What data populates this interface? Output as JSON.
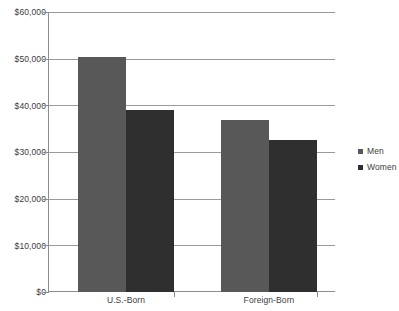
{
  "chart_data": {
    "type": "bar",
    "title": "",
    "subtitle": "",
    "xlabel": "",
    "ylabel": "",
    "categories": [
      "U.S.-Born",
      "Foreign-Born"
    ],
    "series": [
      {
        "name": "Men",
        "values": [
          50400,
          36900
        ],
        "color": "#585858"
      },
      {
        "name": "Women",
        "values": [
          39000,
          32600
        ],
        "color": "#2f2f2f"
      }
    ],
    "ylim": [
      0,
      60000
    ],
    "y_ticks": [
      0,
      10000,
      20000,
      30000,
      40000,
      50000,
      60000
    ],
    "y_tick_labels": [
      "$0",
      "$10,000",
      "$20,000",
      "$30,000",
      "$40,000",
      "$50,000",
      "$60,000"
    ],
    "grid": true,
    "legend_position": "right"
  },
  "axes": {
    "y": {
      "labels": [
        "$60,000",
        "$50,000",
        "$40,000",
        "$30,000",
        "$20,000",
        "$10,000",
        "$0"
      ]
    },
    "x": {
      "labels": [
        "U.S.-Born",
        "Foreign-Born"
      ]
    }
  },
  "legend": {
    "items": [
      {
        "label": "Men",
        "color": "#585858"
      },
      {
        "label": "Women",
        "color": "#2f2f2f"
      }
    ]
  },
  "colors": {
    "men_bar": "#585858",
    "women_bar": "#2f2f2f",
    "gridline": "#9a9a9a",
    "axis": "#8d8d8d",
    "text": "#3b3b3b",
    "background": "#ffffff"
  }
}
